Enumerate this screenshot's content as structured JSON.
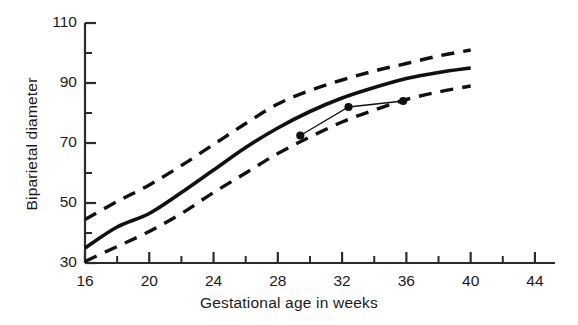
{
  "chart_data": {
    "type": "line",
    "title": "",
    "xlabel": "Gestational age in weeks",
    "ylabel": "Biparietal diameter",
    "xlim": [
      16,
      45
    ],
    "ylim": [
      30,
      110
    ],
    "grid": false,
    "legend": "none",
    "x_major_ticks": [
      16,
      20,
      24,
      28,
      32,
      36,
      40,
      44
    ],
    "x_minor_ticks": [
      18,
      22,
      26,
      30,
      34,
      38,
      42
    ],
    "x_ticklabels": [
      "16",
      "20",
      "24",
      "28",
      "32",
      "36",
      "40",
      "44"
    ],
    "y_major_ticks": [
      30,
      50,
      70,
      90,
      110
    ],
    "y_minor_ticks": [
      40,
      60,
      80,
      100
    ],
    "y_ticklabels": [
      "30",
      "50",
      "70",
      "90",
      "110"
    ],
    "series": [
      {
        "name": "upper-reference-band",
        "style": "dashed",
        "x": [
          16,
          18,
          20,
          22,
          24,
          26,
          28,
          30,
          32,
          34,
          36,
          38,
          40
        ],
        "values": [
          44.5,
          50.5,
          56.0,
          62.5,
          69.5,
          76.5,
          83.0,
          87.5,
          91.0,
          94.0,
          96.5,
          99.0,
          101.0
        ]
      },
      {
        "name": "median-reference-curve",
        "style": "solid",
        "x": [
          16,
          18,
          20,
          22,
          24,
          26,
          28,
          30,
          32,
          34,
          36,
          38,
          40
        ],
        "values": [
          35.0,
          42.0,
          46.5,
          53.5,
          61.0,
          68.5,
          75.0,
          80.5,
          85.0,
          88.5,
          91.5,
          93.5,
          95.0
        ]
      },
      {
        "name": "lower-reference-band",
        "style": "dashed",
        "x": [
          16,
          18,
          20,
          22,
          24,
          26,
          28,
          30,
          32,
          34,
          36,
          38,
          40
        ],
        "values": [
          30.5,
          35.5,
          40.5,
          46.5,
          53.5,
          60.0,
          66.5,
          72.0,
          77.0,
          81.0,
          84.5,
          87.0,
          89.0
        ]
      },
      {
        "name": "patient-measurements",
        "style": "solid-with-markers",
        "x": [
          29.4,
          32.4,
          35.8
        ],
        "values": [
          72.5,
          82.0,
          84.0
        ]
      }
    ]
  },
  "axis": {
    "ylabel_text": "Biparietal diameter",
    "xlabel_text": "Gestational age in weeks"
  },
  "colors": {
    "ink": "#1a1a1a",
    "axis": "#2b2b2b",
    "curve": "#111111"
  }
}
